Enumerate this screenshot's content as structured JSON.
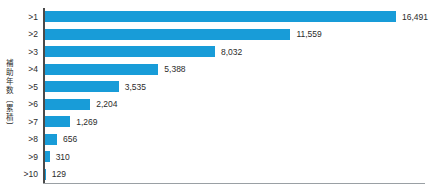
{
  "chart_data": {
    "type": "bar",
    "orientation": "horizontal",
    "title": "",
    "xlabel": "",
    "ylabel": "補助年数〔累積〕",
    "categories": [
      ">1",
      ">2",
      ">3",
      ">4",
      ">5",
      ">6",
      ">7",
      ">8",
      ">9",
      ">10"
    ],
    "values": [
      16491,
      11559,
      8032,
      5388,
      3535,
      2204,
      1269,
      656,
      310,
      129
    ],
    "value_labels": [
      "16,491",
      "11,559",
      "8,032",
      "5,388",
      "3,535",
      "2,204",
      "1,269",
      "656",
      "310",
      "129"
    ],
    "xlim": [
      0,
      17000
    ],
    "grid": false,
    "legend": false,
    "value_labels_position": "end-of-bar",
    "bar_color": "#189CD8",
    "axis_color": "#4a4a4a",
    "baseline_color": "#9aa0a4",
    "text_color": "#2b2b2b"
  }
}
